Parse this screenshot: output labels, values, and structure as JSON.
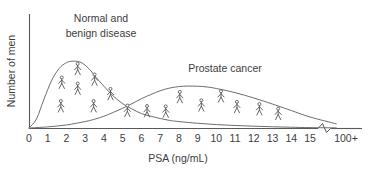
{
  "figure": {
    "background_color": "#ffffff",
    "axis_color": "#58595b",
    "curve_color": "#6d6e71",
    "text_color": "#3c3c3e",
    "figure_icon_color": "#4d4d4f"
  },
  "axes": {
    "x_title": "PSA (ng/mL)",
    "y_title": "Number of men",
    "x_tick_labels": [
      "0",
      "1",
      "2",
      "3",
      "4",
      "5",
      "6",
      "7",
      "8",
      "9",
      "10",
      "11",
      "12",
      "13",
      "14",
      "15",
      "100+"
    ],
    "y_tick_labels": [],
    "has_axis_break": true,
    "axis_break_between": [
      "15",
      "100+"
    ]
  },
  "labels": {
    "curve_one_line_one": "Normal and",
    "curve_one_line_two": "benign disease",
    "curve_two": "Prostate cancer"
  },
  "chart_data": {
    "type": "line",
    "title": "",
    "subtitle": "",
    "xlabel": "PSA (ng/mL)",
    "ylabel": "Number of men",
    "xlim": [
      0,
      16.5
    ],
    "ylim": [
      0,
      1.05
    ],
    "grid": false,
    "legend_position": "inline-annotations",
    "x_ticks": [
      0,
      1,
      2,
      3,
      4,
      5,
      6,
      7,
      8,
      9,
      10,
      11,
      12,
      13,
      14,
      15
    ],
    "x_tick_labels": [
      "0",
      "1",
      "2",
      "3",
      "4",
      "5",
      "6",
      "7",
      "8",
      "9",
      "10",
      "11",
      "12",
      "13",
      "14",
      "15",
      "100+"
    ],
    "y_ticks": [],
    "axis_break": {
      "after": 15.4,
      "label_after": "100+"
    },
    "annotations": [
      {
        "text": "Normal and benign disease",
        "x": 2.6,
        "y": 1.0,
        "target_series": "Normal and benign disease"
      },
      {
        "text": "Prostate cancer",
        "x": 9.4,
        "y": 0.72,
        "target_series": "Prostate cancer"
      }
    ],
    "series": [
      {
        "name": "Normal and benign disease",
        "color": "#6d6e71",
        "x": [
          0.0,
          0.4,
          0.8,
          1.2,
          1.6,
          2.0,
          2.4,
          2.8,
          3.2,
          3.6,
          4.0,
          4.5,
          5.0,
          5.5,
          6.0,
          6.5,
          7.0,
          7.5,
          8.0,
          9.0,
          10.0,
          11.0,
          12.0,
          13.0,
          14.0,
          15.0,
          16.4
        ],
        "values": [
          0.0,
          0.12,
          0.38,
          0.62,
          0.78,
          0.86,
          0.88,
          0.86,
          0.78,
          0.66,
          0.55,
          0.42,
          0.32,
          0.25,
          0.19,
          0.155,
          0.125,
          0.1,
          0.085,
          0.062,
          0.045,
          0.033,
          0.024,
          0.016,
          0.01,
          0.005,
          0.002
        ]
      },
      {
        "name": "Prostate cancer",
        "color": "#6d6e71",
        "x": [
          0.0,
          1.0,
          2.0,
          3.0,
          3.5,
          4.0,
          4.5,
          5.0,
          5.5,
          6.0,
          6.5,
          7.0,
          7.5,
          8.0,
          8.5,
          9.0,
          9.5,
          10.0,
          11.0,
          12.0,
          13.0,
          14.0,
          15.0,
          16.4
        ],
        "values": [
          0.0,
          0.015,
          0.04,
          0.085,
          0.115,
          0.155,
          0.205,
          0.26,
          0.32,
          0.385,
          0.44,
          0.49,
          0.525,
          0.545,
          0.552,
          0.55,
          0.54,
          0.52,
          0.465,
          0.395,
          0.315,
          0.23,
          0.145,
          0.055
        ]
      }
    ],
    "person_icons": {
      "description": "Stick-figure pictograms distributed under each distribution curve",
      "normal_benign_disease": [
        {
          "x": 1.75,
          "y": 0.52
        },
        {
          "x": 2.6,
          "y": 0.7
        },
        {
          "x": 3.5,
          "y": 0.56
        },
        {
          "x": 2.6,
          "y": 0.44
        },
        {
          "x": 4.35,
          "y": 0.37
        },
        {
          "x": 1.7,
          "y": 0.21
        },
        {
          "x": 3.45,
          "y": 0.21
        },
        {
          "x": 5.25,
          "y": 0.15
        },
        {
          "x": 6.3,
          "y": 0.145
        },
        {
          "x": 7.3,
          "y": 0.14
        }
      ],
      "prostate_cancer": [
        {
          "x": 8.05,
          "y": 0.33
        },
        {
          "x": 10.25,
          "y": 0.34
        },
        {
          "x": 9.2,
          "y": 0.22
        },
        {
          "x": 11.1,
          "y": 0.2
        },
        {
          "x": 12.3,
          "y": 0.17
        },
        {
          "x": 13.3,
          "y": 0.11
        }
      ]
    }
  }
}
